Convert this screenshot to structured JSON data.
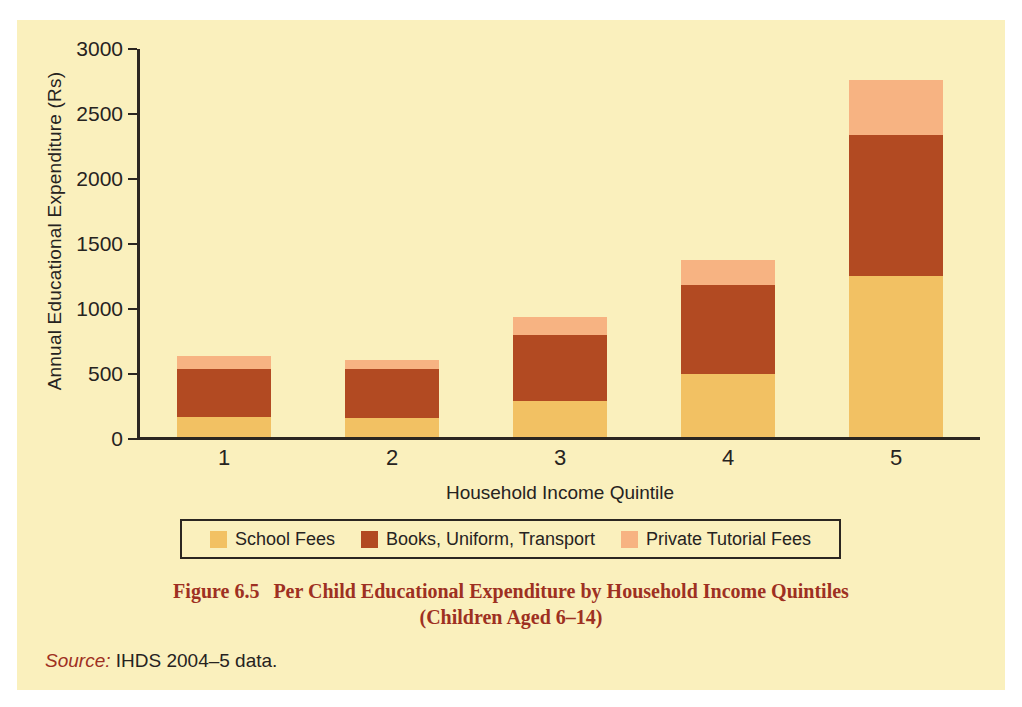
{
  "figure": {
    "caption_number": "Figure 6.5",
    "caption_line1": "Per Child Educational Expenditure by Household Income Quintiles",
    "caption_line2": "(Children Aged 6–14)",
    "source_word": "Source:",
    "source_text": " IHDS 2004–5 data."
  },
  "colors": {
    "background": "#faf0bd",
    "axis": "#2b2621",
    "text": "#26231f",
    "caption": "#9e3022",
    "school_fees": "#f2c163",
    "books_uniform_transport": "#b24a22",
    "private_tutorial_fees": "#f7b382"
  },
  "chart_data": {
    "type": "bar",
    "subtype": "stacked",
    "title": "Per Child Educational Expenditure by Household Income Quintiles (Children Aged 6–14)",
    "xlabel": "Household Income Quintile",
    "ylabel": "Annual Educational Expenditure (Rs)",
    "categories": [
      "1",
      "2",
      "3",
      "4",
      "5"
    ],
    "yticks": [
      0,
      500,
      1000,
      1500,
      2000,
      2500,
      3000
    ],
    "ytick_labels": [
      "0",
      "500",
      "1000",
      "1500",
      "2000",
      "2500",
      "3000"
    ],
    "ylim": [
      0,
      3000
    ],
    "grid": false,
    "legend_position": "bottom",
    "series": [
      {
        "name": "School Fees",
        "color": "#f2c163",
        "values": [
          155,
          145,
          280,
          485,
          1235
        ]
      },
      {
        "name": "Books, Uniform, Transport",
        "color": "#b24a22",
        "values": [
          370,
          380,
          505,
          685,
          1090
        ]
      },
      {
        "name": "Private Tutorial Fees",
        "color": "#f7b382",
        "values": [
          95,
          70,
          140,
          190,
          420
        ]
      }
    ],
    "totals": [
      620,
      595,
      925,
      1360,
      2745
    ]
  }
}
